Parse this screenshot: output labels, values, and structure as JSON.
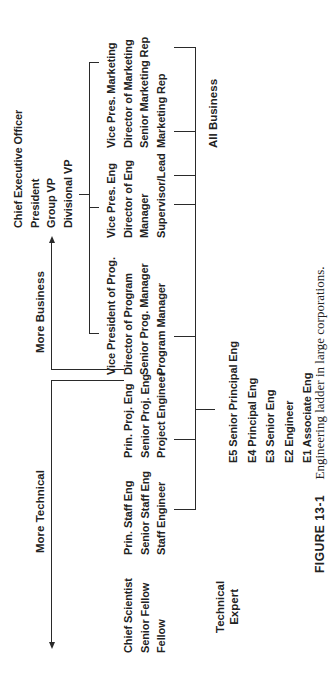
{
  "figure": {
    "caption_label": "FIGURE 13-1",
    "caption_text": "Engineering ladder in large corporations."
  },
  "arrows": {
    "more_technical": "More Technical",
    "more_business": "More Business"
  },
  "groups": {
    "technical_expert": {
      "line1": "Technical",
      "line2": "Expert"
    },
    "all_business": "All Business"
  },
  "top_executive": {
    "titles": [
      "Chief Executive Officer",
      "President",
      "Group VP",
      "Divisional VP"
    ]
  },
  "ladders": {
    "fellow": [
      "Chief Scientist",
      "Senior Fellow",
      "Fellow"
    ],
    "staff": [
      "Prin. Staff Eng",
      "Senior Staff Eng",
      "Staff Engineer"
    ],
    "project": [
      "Prin. Proj. Eng",
      "Senior Proj. Eng",
      "Project Engineer"
    ],
    "program": [
      "Vice President of Prog.",
      "Director of Program",
      "Senior Prog. Manager",
      "Program Manager"
    ],
    "engineering_mgmt": [
      "Vice Pres. Eng",
      "Director of Eng",
      "Manager",
      "Supervisor/Lead"
    ],
    "marketing": [
      "Vice Pres. Marketing",
      "Director of Marketing",
      "Senior Marketing Rep",
      "Marketing Rep"
    ]
  },
  "engineer_levels": [
    "E5 Senior Principal Eng",
    "E4 Principal Eng",
    "E3 Senior Eng",
    "E2 Engineer",
    "E1 Associate Eng"
  ]
}
